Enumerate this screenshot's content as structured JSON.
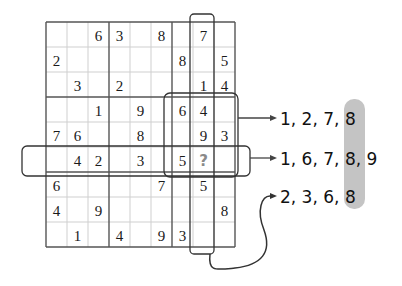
{
  "puzzle": {
    "grid": [
      [
        "",
        "",
        "6",
        "3",
        "",
        "8",
        "",
        "7",
        ""
      ],
      [
        "2",
        "",
        "",
        "",
        "",
        "",
        "8",
        "",
        "5"
      ],
      [
        "",
        "3",
        "",
        "2",
        "",
        "",
        "",
        "1",
        "4"
      ],
      [
        "",
        "",
        "1",
        "",
        "9",
        "",
        "6",
        "4",
        ""
      ],
      [
        "7",
        "6",
        "",
        "",
        "8",
        "",
        "",
        "9",
        "3"
      ],
      [
        "",
        "4",
        "2",
        "",
        "3",
        "",
        "5",
        "?",
        ""
      ],
      [
        "6",
        "",
        "",
        "",
        "",
        "7",
        "",
        "5",
        ""
      ],
      [
        "4",
        "",
        "9",
        "",
        "",
        "",
        "",
        "",
        "8"
      ],
      [
        "",
        "1",
        "",
        "4",
        "",
        "9",
        "3",
        "",
        ""
      ]
    ],
    "unknown_cell": {
      "row": 5,
      "col": 7,
      "symbol": "?"
    },
    "highlighted_column": 7,
    "highlighted_row": 5,
    "highlighted_box": {
      "row": 1,
      "col": 2
    }
  },
  "candidates": {
    "box": {
      "label": "1, 2, 7, 8",
      "parts": [
        "1, 2, 7, ",
        "8"
      ]
    },
    "row": {
      "label": "1, 6, 7, 8, 9",
      "parts": [
        "1, 6, 7, ",
        "8",
        ", 9"
      ]
    },
    "column": {
      "label": "2, 3, 6, 8",
      "parts": [
        "2, 3, 6, ",
        "8"
      ]
    }
  },
  "common_value": "8",
  "colors": {
    "grid_line": "#555555",
    "thin_line": "#c8c8c8",
    "outline": "#333333",
    "highlight_band": "#c4c4c4",
    "question_mark": "#8a8a8a"
  }
}
